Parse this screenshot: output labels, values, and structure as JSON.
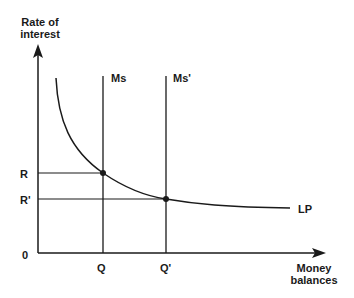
{
  "diagram": {
    "y_axis_label_line1": "Rate of",
    "y_axis_label_line2": "interest",
    "x_axis_label_line1": "Money",
    "x_axis_label_line2": "balances",
    "origin_label": "0",
    "rate_labels": {
      "R": "R",
      "R_prime": "R'"
    },
    "quantity_labels": {
      "Q": "Q",
      "Q_prime": "Q'"
    },
    "supply_labels": {
      "Ms": "Ms",
      "Ms_prime": "Ms'"
    },
    "demand_curve_label": "LP",
    "colors": {
      "line": "#1a1a1a",
      "background": "#ffffff"
    }
  }
}
